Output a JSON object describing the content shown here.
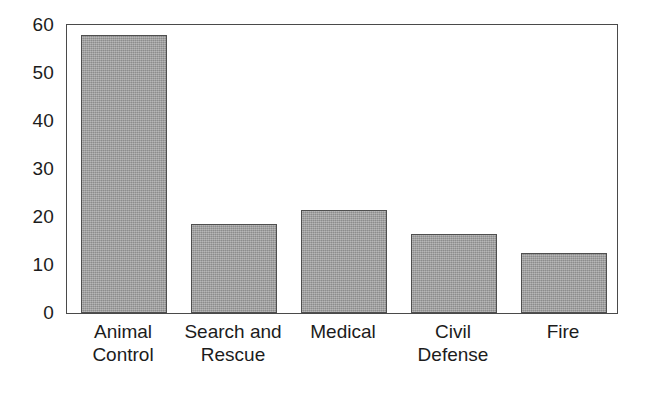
{
  "chart_data": {
    "type": "bar",
    "title": "",
    "subtitle": "",
    "xlabel": "",
    "ylabel": "",
    "categories": [
      "Animal Control",
      "Search and Rescue",
      "Medical",
      "Civil Defense",
      "Fire"
    ],
    "values": [
      58,
      18.5,
      21.5,
      16.5,
      12.5
    ],
    "series": [
      {
        "name": "",
        "values": [
          58,
          18.5,
          21.5,
          16.5,
          12.5
        ]
      }
    ],
    "ylim": [
      0,
      60
    ],
    "yticks": [
      0,
      10,
      20,
      30,
      40,
      50,
      60
    ],
    "ytick_labels": [
      "0",
      "10",
      "20",
      "30",
      "40",
      "50",
      "60"
    ],
    "grid": false,
    "legend": false,
    "legend_position": "none",
    "bar_color": "#9c9c9c",
    "bar_edge_color": "#4f4f4f",
    "frame_color": "#4a4a4a",
    "background": "#ffffff",
    "annotations": []
  },
  "axes": {
    "y_ticks": [
      {
        "label": "60",
        "value": 60
      },
      {
        "label": "50",
        "value": 50
      },
      {
        "label": "40",
        "value": 40
      },
      {
        "label": "30",
        "value": 30
      },
      {
        "label": "20",
        "value": 20
      },
      {
        "label": "10",
        "value": 10
      },
      {
        "label": "0",
        "value": 0
      }
    ],
    "x_categories": [
      {
        "line1": "Animal",
        "line2": "Control"
      },
      {
        "line1": "Search and",
        "line2": "Rescue"
      },
      {
        "line1": "Medical",
        "line2": ""
      },
      {
        "line1": "Civil",
        "line2": "Defense"
      },
      {
        "line1": "Fire",
        "line2": ""
      }
    ]
  }
}
